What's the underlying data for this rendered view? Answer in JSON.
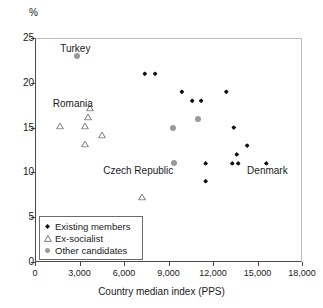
{
  "chart_data": {
    "type": "scatter",
    "title": "",
    "xlabel": "Country median index (PPS)",
    "ylabel": "%",
    "unit_label": "%",
    "xlim": [
      0,
      18000
    ],
    "ylim": [
      0,
      25
    ],
    "grid": false,
    "legend_position": "bottom-left",
    "xticks": [
      0,
      3000,
      6000,
      9000,
      12000,
      15000,
      18000
    ],
    "xtick_labels": [
      "0",
      "3,000",
      "6,000",
      "9,000",
      "12,000",
      "15,000",
      "18,000"
    ],
    "yticks": [
      0,
      5,
      10,
      15,
      20,
      25
    ],
    "ytick_labels": [
      "0",
      "5",
      "10",
      "15",
      "20",
      "25"
    ],
    "series": [
      {
        "name": "Existing members",
        "marker": "diamond",
        "color": "#111111",
        "points": [
          {
            "x": 7400,
            "y": 21
          },
          {
            "x": 8100,
            "y": 21
          },
          {
            "x": 9900,
            "y": 19
          },
          {
            "x": 10600,
            "y": 18
          },
          {
            "x": 11200,
            "y": 18
          },
          {
            "x": 12900,
            "y": 19
          },
          {
            "x": 13400,
            "y": 15
          },
          {
            "x": 14300,
            "y": 13
          },
          {
            "x": 13600,
            "y": 12
          },
          {
            "x": 11500,
            "y": 11
          },
          {
            "x": 13300,
            "y": 11
          },
          {
            "x": 13700,
            "y": 11
          },
          {
            "x": 15600,
            "y": 11
          },
          {
            "x": 11500,
            "y": 9
          }
        ]
      },
      {
        "name": "Ex-socialist",
        "marker": "triangle",
        "color": "#6b6b6b",
        "points": [
          {
            "x": 1700,
            "y": 16
          },
          {
            "x": 3400,
            "y": 16
          },
          {
            "x": 3700,
            "y": 18
          },
          {
            "x": 3600,
            "y": 17
          },
          {
            "x": 4500,
            "y": 15
          },
          {
            "x": 3400,
            "y": 14
          },
          {
            "x": 7200,
            "y": 8
          }
        ]
      },
      {
        "name": "Other candidates",
        "marker": "circle",
        "color": "#9a9a9a",
        "points": [
          {
            "x": 2800,
            "y": 23
          },
          {
            "x": 9300,
            "y": 15
          },
          {
            "x": 11000,
            "y": 16
          },
          {
            "x": 9400,
            "y": 11
          }
        ]
      }
    ],
    "annotations": [
      {
        "text": "Turkey",
        "x": 1700,
        "y": 23.8
      },
      {
        "text": "Romania",
        "x": 1200,
        "y": 17.6
      },
      {
        "text": "Czech Republic",
        "x": 4600,
        "y": 10.2
      },
      {
        "text": "Denmark",
        "x": 14300,
        "y": 10.2
      }
    ]
  },
  "legend": {
    "items": [
      {
        "label": "Existing members",
        "marker": "diamond"
      },
      {
        "label": "Ex-socialist",
        "marker": "triangle"
      },
      {
        "label": "Other candidates",
        "marker": "circle"
      }
    ]
  }
}
